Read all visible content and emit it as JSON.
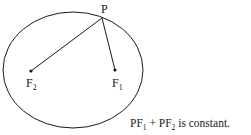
{
  "diagram": {
    "ellipse": {
      "cx": 73,
      "cy": 70,
      "rx": 70,
      "ry": 58
    },
    "points": {
      "P": {
        "label": "P",
        "x": 102,
        "y": 18
      },
      "F2": {
        "label": "F",
        "sub": "2",
        "x": 31,
        "y": 71
      },
      "F1": {
        "label": "F",
        "sub": "1",
        "x": 115,
        "y": 70
      }
    },
    "segments": [
      {
        "from": "P",
        "to": "F2"
      },
      {
        "from": "P",
        "to": "F1"
      }
    ],
    "caption": {
      "term1": "PF",
      "term1_sub": "1",
      "plus": " + ",
      "term2": "PF",
      "term2_sub": "2",
      "rest": " is constant."
    },
    "colors": {
      "stroke": "#1a1a1a",
      "background": "#ffffff"
    }
  }
}
